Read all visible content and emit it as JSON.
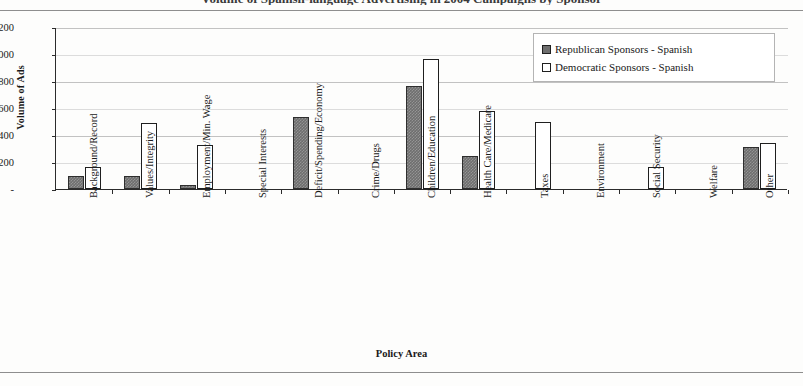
{
  "figure": {
    "title_remnant": "Volume of Spanish-language Advertising in 2004 Campaigns by Sponsor",
    "y_axis_title": "Volume of Ads",
    "x_axis_title": "Policy Area"
  },
  "legend": {
    "items": [
      {
        "label": "Republican Sponsors - Spanish",
        "swatch": "filled-gray-square",
        "color": "#6e6e6e"
      },
      {
        "label": "Democratic Sponsors - Spanish",
        "swatch": "white-outline-square",
        "color": "#ffffff"
      }
    ]
  },
  "y_ticks": [
    "-",
    "200",
    "400",
    "600",
    "800",
    "1,000",
    "1,200"
  ],
  "chart_data": {
    "type": "bar",
    "title": "",
    "xlabel": "Policy Area",
    "ylabel": "Volume of Ads",
    "ylim": [
      0,
      1200
    ],
    "ytick_values": [
      0,
      200,
      400,
      600,
      800,
      1000,
      1200
    ],
    "ytick_labels": [
      "-",
      "200",
      "400",
      "600",
      "800",
      "1,000",
      "1,200"
    ],
    "grid": true,
    "legend_position": "top-right",
    "categories": [
      "Background/Record",
      "Values/Integrity",
      "Employment/Min. Wage",
      "Special Interests",
      "Deficit/Spending/Economy",
      "Crime/Drugs",
      "Children/Education",
      "Health Care/Medicare",
      "Taxes",
      "Environment",
      "Social Security",
      "Welfare",
      "Other"
    ],
    "series": [
      {
        "name": "Republican Sponsors - Spanish",
        "color": "#6e6e6e",
        "values": [
          100,
          100,
          30,
          0,
          530,
          0,
          765,
          245,
          0,
          0,
          0,
          0,
          310
        ]
      },
      {
        "name": "Democratic Sponsors - Spanish",
        "color": "#ffffff",
        "values": [
          165,
          490,
          325,
          0,
          0,
          0,
          965,
          575,
          495,
          0,
          165,
          0,
          340
        ]
      }
    ]
  }
}
